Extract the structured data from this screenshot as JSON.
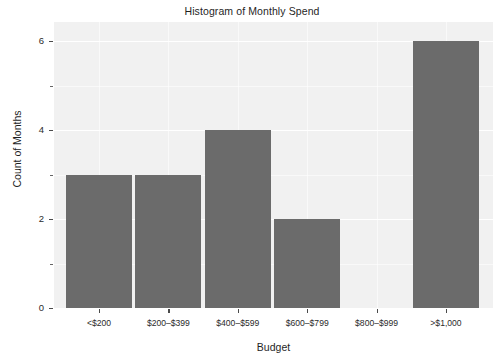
{
  "chart_data": {
    "type": "bar",
    "title": "Histogram of Monthly Spend",
    "xlabel": "Budget",
    "ylabel": "Count of Months",
    "categories": [
      "<$200",
      "$200–$399",
      "$400–$599",
      "$600–$799",
      "$800–$999",
      ">$1,000"
    ],
    "values": [
      3,
      3,
      4,
      2,
      0,
      6
    ],
    "ylim": [
      0,
      6.3
    ],
    "y_major_ticks": [
      0,
      2,
      4,
      6
    ],
    "y_major_tick_labels": [
      "0",
      "2",
      "4",
      "6"
    ],
    "y_minor_ticks": [
      1,
      3,
      5
    ],
    "grid": true,
    "legend": "none",
    "bar_color": "#6b6b6b",
    "panel_background": "#f1f1f1",
    "gridline_color": "#ffffff"
  }
}
